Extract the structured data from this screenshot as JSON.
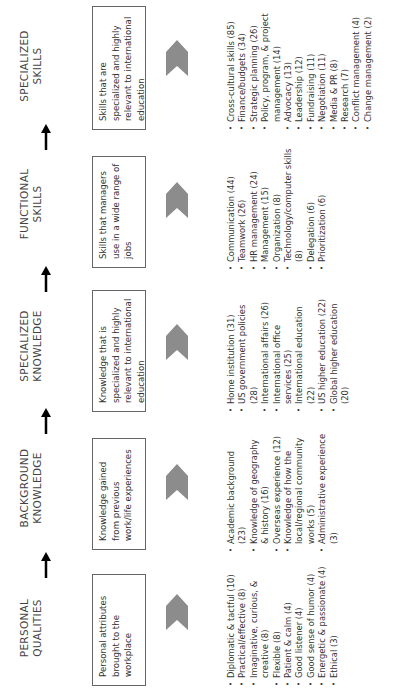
{
  "diagram": {
    "orientation": "rotated 90 degrees counter-clockwise",
    "colors": {
      "chevron_fill": "#8c8c8c",
      "box_border": "#666666",
      "arrow": "#000000",
      "text": "#333333"
    },
    "columns": [
      {
        "heading": [
          "PERSONAL",
          "QUALITIES"
        ],
        "description": "Personal attributes brought to the workplace",
        "items": [
          "Diplomatic & tactful (10)",
          "Practical/effective (8)",
          "Imaginative, curious, & creative (8)",
          "Flexible (8)",
          "Patient & calm (4)",
          "Good listener (4)",
          "Good sense of humor (4)",
          "Energetic & passionate (4)",
          "Ethical (3)"
        ]
      },
      {
        "heading": [
          "BACKGROUND",
          "KNOWLEDGE"
        ],
        "description": "Knowledge gained from previous work/life experiences",
        "items": [
          "Academic background (23)",
          "Knowledge of geography & history (16)",
          "Overseas experience (12)",
          "Knowledge of how the local/regional community works (5)",
          "Administrative experience (3)"
        ]
      },
      {
        "heading": [
          "SPECIALIZED",
          "KNOWLEDGE"
        ],
        "description": "Knowledge that is specialized and highly relevant to international education",
        "items": [
          "Home institution (31)",
          "US government policies (28)",
          "International affairs (26)",
          "International office services (25)",
          "International education (22)",
          "US higher education (22)",
          "Global higher education (20)"
        ]
      },
      {
        "heading": [
          "FUNCTIONAL",
          "SKILLS"
        ],
        "description": "Skills that managers use in a wide range of jobs",
        "items": [
          "Communication (44)",
          "Teamwork (26)",
          "HR management (24)",
          "Management (15)",
          "Organization (8)",
          "Technology/computer skills (8)",
          "Delegation (6)",
          "Prioritization (6)"
        ]
      },
      {
        "heading": [
          "SPECIALIZED",
          "SKILLS"
        ],
        "description": "Skills that are specialized and highly relevant to international education",
        "items": [
          "Cross-cultural skills (85)",
          "Finance/budgets (34)",
          "Strategic planning (26)",
          "Policy, program, & project management (14)",
          "Advocacy (13)",
          "Leadership (12)",
          "Fundraising (11)",
          "Negotiation (11)",
          "Media & PR (8)",
          "Research (7)",
          "Conflict management (4)",
          "Change management (2)"
        ]
      }
    ],
    "icons": {
      "chevron": "chevron-right-icon",
      "arrow": "arrow-right-icon"
    }
  }
}
